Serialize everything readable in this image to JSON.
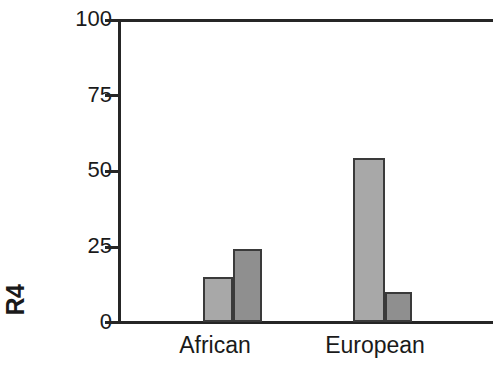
{
  "chart_data": {
    "type": "bar",
    "title": "",
    "subtitle": "",
    "xlabel": "",
    "ylabel": "R4",
    "categories": [
      "African",
      "European"
    ],
    "series": [
      {
        "name": "series-1",
        "color": "#a8a8a8",
        "values": [
          15,
          54
        ]
      },
      {
        "name": "series-2",
        "color": "#8f8f8f",
        "values": [
          24,
          10
        ]
      }
    ],
    "ylim": [
      0,
      100
    ],
    "yticks": [
      0,
      25,
      50,
      75,
      100
    ],
    "ytick_labels": [
      "0",
      "25",
      "50",
      "75",
      "100"
    ],
    "grid": false,
    "legend": "none"
  },
  "axis": {
    "y_label": "R4",
    "tick_0": "0",
    "tick_25": "25",
    "tick_50": "50",
    "tick_75": "75",
    "tick_100": "100"
  },
  "categories": {
    "african": "African",
    "european": "European"
  },
  "colors": {
    "bar_light": "#a8a8a8",
    "bar_dark": "#8f8f8f",
    "axis": "#262626",
    "bar_border": "#3a3a3a",
    "background": "#ffffff"
  }
}
